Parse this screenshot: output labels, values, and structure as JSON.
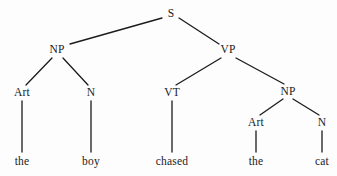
{
  "diagram": {
    "kind": "syntax-tree",
    "sentence": "the boy chased the cat",
    "background_color": "#fdfdfd",
    "line_color": "#1b1b1b",
    "text_color": "#1b1b1b",
    "nodes": [
      {
        "id": "S",
        "label": "S",
        "x": 171,
        "y": 14,
        "level": "category"
      },
      {
        "id": "NP1",
        "label": "NP",
        "x": 57,
        "y": 50,
        "level": "category"
      },
      {
        "id": "VP",
        "label": "VP",
        "x": 228,
        "y": 50,
        "level": "category"
      },
      {
        "id": "Art1",
        "label": "Art",
        "x": 22,
        "y": 93,
        "level": "category"
      },
      {
        "id": "N1",
        "label": "N",
        "x": 91,
        "y": 93,
        "level": "category"
      },
      {
        "id": "VT",
        "label": "VT",
        "x": 172,
        "y": 93,
        "level": "category"
      },
      {
        "id": "NP2",
        "label": "NP",
        "x": 288,
        "y": 92,
        "level": "category"
      },
      {
        "id": "Art2",
        "label": "Art",
        "x": 256,
        "y": 123,
        "level": "category"
      },
      {
        "id": "N2",
        "label": "N",
        "x": 322,
        "y": 123,
        "level": "category"
      },
      {
        "id": "w1",
        "label": "the",
        "x": 22,
        "y": 162,
        "level": "word"
      },
      {
        "id": "w2",
        "label": "boy",
        "x": 91,
        "y": 162,
        "level": "word"
      },
      {
        "id": "w3",
        "label": "chased",
        "x": 172,
        "y": 162,
        "level": "word"
      },
      {
        "id": "w4",
        "label": "the",
        "x": 256,
        "y": 162,
        "level": "word"
      },
      {
        "id": "w5",
        "label": "cat",
        "x": 322,
        "y": 162,
        "level": "word"
      }
    ],
    "edges": [
      {
        "from": "S",
        "to": "NP1",
        "x1": 162,
        "y1": 18,
        "x2": 70,
        "y2": 44
      },
      {
        "from": "S",
        "to": "VP",
        "x1": 179,
        "y1": 18,
        "x2": 219,
        "y2": 44
      },
      {
        "from": "NP1",
        "to": "Art1",
        "x1": 52,
        "y1": 58,
        "x2": 26,
        "y2": 85
      },
      {
        "from": "NP1",
        "to": "N1",
        "x1": 63,
        "y1": 58,
        "x2": 88,
        "y2": 85
      },
      {
        "from": "VP",
        "to": "VT",
        "x1": 221,
        "y1": 58,
        "x2": 176,
        "y2": 85
      },
      {
        "from": "VP",
        "to": "NP2",
        "x1": 236,
        "y1": 58,
        "x2": 284,
        "y2": 84
      },
      {
        "from": "NP2",
        "to": "Art2",
        "x1": 283,
        "y1": 99,
        "x2": 260,
        "y2": 115
      },
      {
        "from": "NP2",
        "to": "N2",
        "x1": 293,
        "y1": 99,
        "x2": 319,
        "y2": 115
      },
      {
        "from": "Art1",
        "to": "w1",
        "x1": 22,
        "y1": 101,
        "x2": 22,
        "y2": 152
      },
      {
        "from": "N1",
        "to": "w2",
        "x1": 91,
        "y1": 101,
        "x2": 91,
        "y2": 152
      },
      {
        "from": "VT",
        "to": "w3",
        "x1": 172,
        "y1": 101,
        "x2": 172,
        "y2": 152
      },
      {
        "from": "Art2",
        "to": "w4",
        "x1": 256,
        "y1": 131,
        "x2": 256,
        "y2": 152
      },
      {
        "from": "N2",
        "to": "w5",
        "x1": 322,
        "y1": 131,
        "x2": 322,
        "y2": 152
      }
    ]
  }
}
